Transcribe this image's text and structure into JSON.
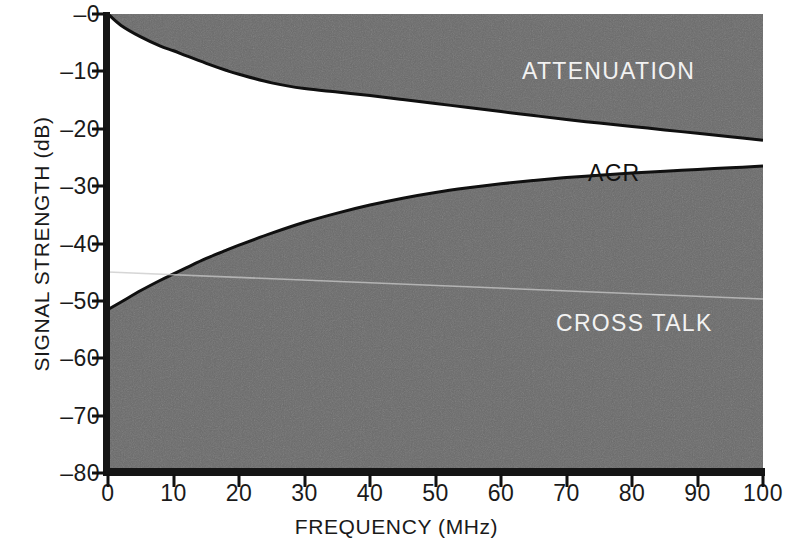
{
  "chart_data": {
    "type": "area",
    "title": "",
    "xlabel": "FREQUENCY (MHz)",
    "ylabel": "SIGNAL STRENGTH (dB)",
    "xlim": [
      0,
      100
    ],
    "ylim": [
      -80,
      0
    ],
    "grid": false,
    "legend_position": "inline-annotations",
    "xticks": [
      "0",
      "10",
      "20",
      "30",
      "40",
      "50",
      "60",
      "70",
      "80",
      "90",
      "100"
    ],
    "xtick_values": [
      0,
      10,
      20,
      30,
      40,
      50,
      60,
      70,
      80,
      90,
      100
    ],
    "yticks": [
      "–0",
      "–10",
      "–20",
      "–30",
      "–40",
      "–50",
      "–60",
      "–70",
      "–80"
    ],
    "ytick_values": [
      0,
      -10,
      -20,
      -30,
      -40,
      -50,
      -60,
      -70,
      -80
    ],
    "colors": {
      "fill_gray": "#6a6a6a",
      "fill_white": "#ffffff",
      "axis": "#151515",
      "label_light": "#f2f2f2",
      "label_dark": "#111111"
    },
    "annotations": [
      {
        "name": "attenuation-label",
        "text": "ATTENUATION",
        "x": 48,
        "y": -6,
        "color": "#f2f2f2"
      },
      {
        "name": "acr-label",
        "text": "ACR",
        "x": 62,
        "y": -24,
        "color": "#111111"
      },
      {
        "name": "crosstalk-label",
        "text": "CROSS TALK",
        "x": 55,
        "y": -51,
        "color": "#f2f2f2"
      }
    ],
    "series": [
      {
        "name": "ATTENUATION",
        "description": "Upper boundary: signal attenuation vs frequency. Gray region above the curve.",
        "x": [
          0,
          2,
          5,
          8,
          10,
          12,
          15,
          18,
          20,
          25,
          30,
          35,
          40,
          45,
          50,
          55,
          60,
          65,
          70,
          75,
          80,
          85,
          90,
          95,
          100
        ],
        "values": [
          0,
          -2.0,
          -4.0,
          -5.6,
          -6.4,
          -7.3,
          -8.6,
          -9.8,
          -10.5,
          -12.0,
          -13.0,
          -13.6,
          -14.2,
          -14.9,
          -15.6,
          -16.3,
          -17.0,
          -17.7,
          -18.4,
          -19.0,
          -19.6,
          -20.2,
          -20.8,
          -21.4,
          -22.0
        ]
      },
      {
        "name": "CROSS TALK",
        "description": "Lower boundary: near-end crosstalk vs frequency. Gray region below the curve.",
        "x": [
          0,
          2,
          5,
          8,
          10,
          12,
          15,
          18,
          20,
          25,
          30,
          35,
          40,
          45,
          50,
          55,
          60,
          65,
          70,
          75,
          80,
          85,
          90,
          95,
          100
        ],
        "values": [
          -51.5,
          -50.2,
          -48.2,
          -46.4,
          -45.3,
          -44.2,
          -42.6,
          -41.2,
          -40.3,
          -38.2,
          -36.3,
          -34.7,
          -33.3,
          -32.1,
          -31.1,
          -30.3,
          -29.6,
          -29.0,
          -28.5,
          -28.1,
          -27.7,
          -27.4,
          -27.1,
          -26.8,
          -26.5
        ]
      }
    ],
    "acr_band": {
      "name": "ACR",
      "description": "White band between the attenuation curve and the crosstalk curve (Attenuation-to-Crosstalk Ratio)."
    }
  }
}
